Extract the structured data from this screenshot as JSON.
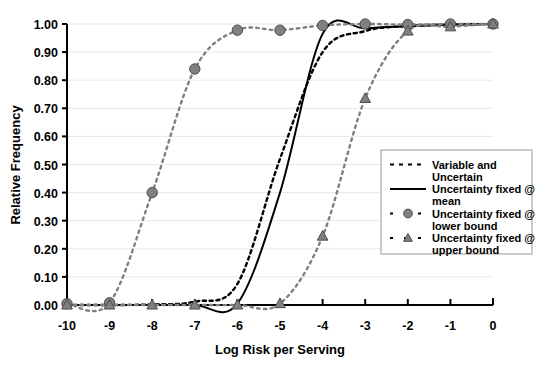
{
  "chart_data": {
    "type": "line",
    "title": "",
    "xlabel": "Log Risk per Serving",
    "ylabel": "Relative Frequency",
    "xlim": [
      -10,
      0
    ],
    "ylim": [
      0.0,
      1.0
    ],
    "grid": true,
    "x_ticks": [
      "-10",
      "-9",
      "-8",
      "-7",
      "-6",
      "-5",
      "-4",
      "-3",
      "-2",
      "-1",
      "0"
    ],
    "x_tick_values": [
      -10,
      -9,
      -8,
      -7,
      -6,
      -5,
      -4,
      -3,
      -2,
      -1,
      0
    ],
    "y_ticks": [
      "0.00",
      "0.10",
      "0.20",
      "0.30",
      "0.40",
      "0.50",
      "0.60",
      "0.70",
      "0.80",
      "0.90",
      "1.00"
    ],
    "y_tick_values": [
      0.0,
      0.1,
      0.2,
      0.3,
      0.4,
      0.5,
      0.6,
      0.7,
      0.8,
      0.9,
      1.0
    ],
    "legend_position": "right-center",
    "x": [
      -10,
      -9,
      -8,
      -7,
      -6,
      -5,
      -4,
      -3,
      -2,
      -1,
      0
    ],
    "series": [
      {
        "name": "Variable and Uncertain",
        "style": "dashed",
        "marker": "none",
        "color": "#000000",
        "values": [
          0.0,
          0.0,
          0.002,
          0.012,
          0.075,
          0.52,
          0.9,
          0.975,
          0.993,
          0.998,
          1.0
        ]
      },
      {
        "name": "Uncertainty fixed @ mean",
        "style": "solid",
        "marker": "none",
        "color": "#000000",
        "values": [
          0.0,
          0.0,
          0.0,
          0.0,
          0.005,
          0.4,
          0.965,
          0.985,
          0.992,
          0.997,
          1.0
        ]
      },
      {
        "name": "Uncertainty fixed @ lower bound",
        "style": "dashed",
        "marker": "circle",
        "color": "#808080",
        "values": [
          0.005,
          0.008,
          0.4,
          0.84,
          0.978,
          0.978,
          0.995,
          1.0,
          0.998,
          1.0,
          1.0
        ]
      },
      {
        "name": "Uncertainty fixed @ upper bound",
        "style": "dashed",
        "marker": "triangle",
        "color": "#808080",
        "values": [
          0.0,
          0.0,
          0.0,
          0.0,
          0.0,
          0.005,
          0.245,
          0.735,
          0.975,
          0.99,
          1.0
        ]
      }
    ]
  },
  "axes": {
    "x_title": "Log Risk per Serving",
    "y_title": "Relative Frequency",
    "x_tick_labels": [
      "-10",
      "-9",
      "-8",
      "-7",
      "-6",
      "-5",
      "-4",
      "-3",
      "-2",
      "-1",
      "0"
    ],
    "y_tick_labels": [
      "0.00",
      "0.10",
      "0.20",
      "0.30",
      "0.40",
      "0.50",
      "0.60",
      "0.70",
      "0.80",
      "0.90",
      "1.00"
    ]
  },
  "legend": {
    "items": [
      {
        "line1": "Variable and",
        "line2": "Uncertain",
        "marker": "none",
        "style": "dashed"
      },
      {
        "line1": "Uncertainty fixed @",
        "line2": "mean",
        "marker": "none",
        "style": "solid"
      },
      {
        "line1": "Uncertainty fixed @",
        "line2": "lower bound",
        "marker": "circle",
        "style": "dashed"
      },
      {
        "line1": "Uncertainty fixed @",
        "line2": "upper bound",
        "marker": "triangle",
        "style": "dashed"
      }
    ]
  },
  "colors": {
    "axis": "#000000",
    "grid": "#e8e8e8",
    "marker_fill": "#808080",
    "marker_edge": "#4d4d4d",
    "legend_border": "#999999",
    "background": "#ffffff"
  }
}
